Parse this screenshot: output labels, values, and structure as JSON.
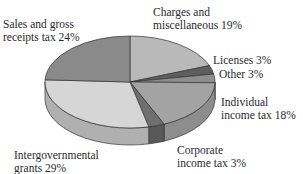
{
  "chart_data": {
    "type": "pie",
    "title": "",
    "style": "3d-pie",
    "categories": [
      "Charges and miscellaneous",
      "Licenses",
      "Other",
      "Individual income tax",
      "Corporate income tax",
      "Intergovernmental grants",
      "Sales and gross receipts tax"
    ],
    "values": [
      19,
      3,
      3,
      18,
      3,
      29,
      24
    ],
    "unit": "%",
    "colors": [
      "#b9b9b9",
      "#5e5e5e",
      "#8e8e8e",
      "#a3a3a3",
      "#6f6f6f",
      "#d6d6d6",
      "#8a8a8a"
    ],
    "side_colors": [
      "#9a9a9a",
      "#4a4a4a",
      "#777777",
      "#8d8d8d",
      "#595959",
      "#b0b0b0",
      "#727272"
    ]
  },
  "labels": [
    {
      "line1": "Charges and",
      "line2": "miscellaneous 19%"
    },
    {
      "line1": "Licenses 3%",
      "line2": ""
    },
    {
      "line1": "Other 3%",
      "line2": ""
    },
    {
      "line1": "Individual",
      "line2": "income tax 18%"
    },
    {
      "line1": "Corporate",
      "line2": "income tax 3%"
    },
    {
      "line1": "Intergovernmental",
      "line2": "grants 29%"
    },
    {
      "line1": "Sales and gross",
      "line2": "receipts tax 24%"
    }
  ]
}
